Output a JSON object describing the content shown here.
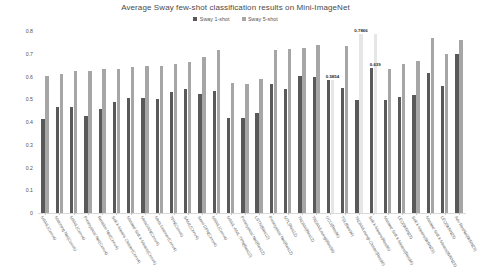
{
  "chart_data": {
    "type": "bar",
    "title": "Average Sway few-shot classification results on Mini-ImageNet",
    "xlabel": "",
    "ylabel": "",
    "ylim": [
      0,
      0.8
    ],
    "ytick_labels": [
      "0",
      "0.1",
      "0.2",
      "0.3",
      "0.4",
      "0.5",
      "0.6",
      "0.7",
      "0.8"
    ],
    "ytick_values": [
      0,
      0.1,
      0.2,
      0.3,
      0.4,
      0.5,
      0.6,
      0.7,
      0.8
    ],
    "grid": false,
    "legend_position": "top-center",
    "legend": [
      "Sway 1-shot",
      "Sway 5-shot"
    ],
    "categories": [
      "MAML(Conv4)",
      "Matching Net(Conv4)",
      "MAML(Conv4)",
      "Prototypical Net(Conv4)",
      "Relation Net(Conv4)",
      "Soft k-Means Cluster(Conv4)",
      "Masked Soft k-Means(Conv4)",
      "MetaGAN(Conv4)",
      "Meta-Learner(Conv4)",
      "TPN(Conv4)",
      "SAML(Conv4)",
      "Semi DPN(Conv4)",
      "MAML(Conv4)",
      "MAML-AML-TPN(Res12)",
      "Prototypical Net(Res12)",
      "LSTM(Res12)",
      "Prototypical Net(Res12)",
      "MTL(Res12)",
      "TADAM(Res12)",
      "TADAMLoungi(Res96)",
      "UCO(Res96)",
      "TSL(Res96)",
      "TADAMLoungi-Cluster(Res96)",
      "Soft k-Means(Res96)",
      "Masked Soft k-Means(Res96)",
      "LEO(WRN28)",
      "Soft k-Means(WRN28)",
      "Masked Soft k-Means(WRN28)",
      "LEO(WRN28)",
      "Adv ResNet(WRN28)"
    ],
    "series": [
      {
        "name": "Sway 1-shot",
        "values": [
          0.412,
          0.466,
          0.467,
          0.425,
          0.457,
          0.489,
          0.505,
          0.505,
          0.501,
          0.532,
          0.547,
          0.522,
          0.535,
          0.417,
          0.417,
          0.44,
          0.567,
          0.544,
          0.603,
          0.597,
          0.585,
          0.548,
          0.496,
          0.638,
          0.497,
          0.509,
          0.518,
          0.617,
          0.558,
          0.7
        ]
      },
      {
        "name": "Sway 5-shot",
        "values": [
          0.601,
          0.611,
          0.624,
          0.624,
          0.634,
          0.632,
          0.644,
          0.645,
          0.647,
          0.655,
          0.666,
          0.686,
          0.718,
          0.57,
          0.568,
          0.59,
          0.718,
          0.721,
          0.727,
          0.739,
          0.5854,
          0.732,
          0.7866,
          0.7866,
          0.631,
          0.655,
          0.668,
          0.77,
          0.7,
          0.76
        ]
      }
    ],
    "highlighted_bars": [
      {
        "category_index": 20,
        "series": "Sway 5-shot",
        "value": 0.5854,
        "label": "0.5854"
      },
      {
        "category_index": 22,
        "series": "Sway 5-shot",
        "value": 0.7866,
        "label": "0.7866"
      },
      {
        "category_index": 23,
        "series": "Sway 5-shot",
        "value": 0.639,
        "label": "0.639"
      }
    ],
    "colors": {
      "series_1shot": "#595959",
      "series_5shot": "#a6a6a6",
      "highlight": "#e6e6e6",
      "title": "#4a4a4a",
      "axis": "#d9d9d9"
    }
  }
}
